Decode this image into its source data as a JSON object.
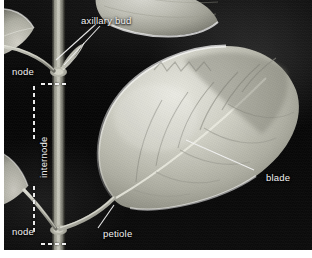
{
  "figure": {
    "background_color": "#0a0a0a",
    "label_color": "#f2f2f2",
    "plate_border_color": "#ffffff"
  },
  "annotations": {
    "axillary_bud": {
      "label": "axillary bud",
      "x": 77,
      "y": 15
    },
    "node_upper": {
      "label": "node",
      "x": 8,
      "y": 68
    },
    "internode": {
      "label": "internode",
      "x": 25,
      "y": 175
    },
    "node_lower": {
      "label": "node",
      "x": 8,
      "y": 228
    },
    "petiole": {
      "label": "petiole",
      "x": 99,
      "y": 230
    },
    "blade": {
      "label": "blade",
      "x": 264,
      "y": 178
    }
  },
  "plant_parts": [
    {
      "name": "stem",
      "description": "vertical main axis"
    },
    {
      "name": "node-upper",
      "description": "point where upper leaves attach"
    },
    {
      "name": "node-lower",
      "description": "point where lower leaves attach"
    },
    {
      "name": "internode",
      "description": "stem region between the two nodes"
    },
    {
      "name": "axillary-bud",
      "description": "bud in the leaf axil at the upper node"
    },
    {
      "name": "petiole",
      "description": "leaf stalk joining blade to stem"
    },
    {
      "name": "blade-main",
      "description": "large ovate leaf blade, right"
    },
    {
      "name": "blade-upper-left",
      "description": "partial leaf blade, upper left"
    },
    {
      "name": "blade-upper-right",
      "description": "partial leaf blade, top right"
    },
    {
      "name": "blade-lower-left",
      "description": "partial leaf blade, lower left"
    }
  ]
}
